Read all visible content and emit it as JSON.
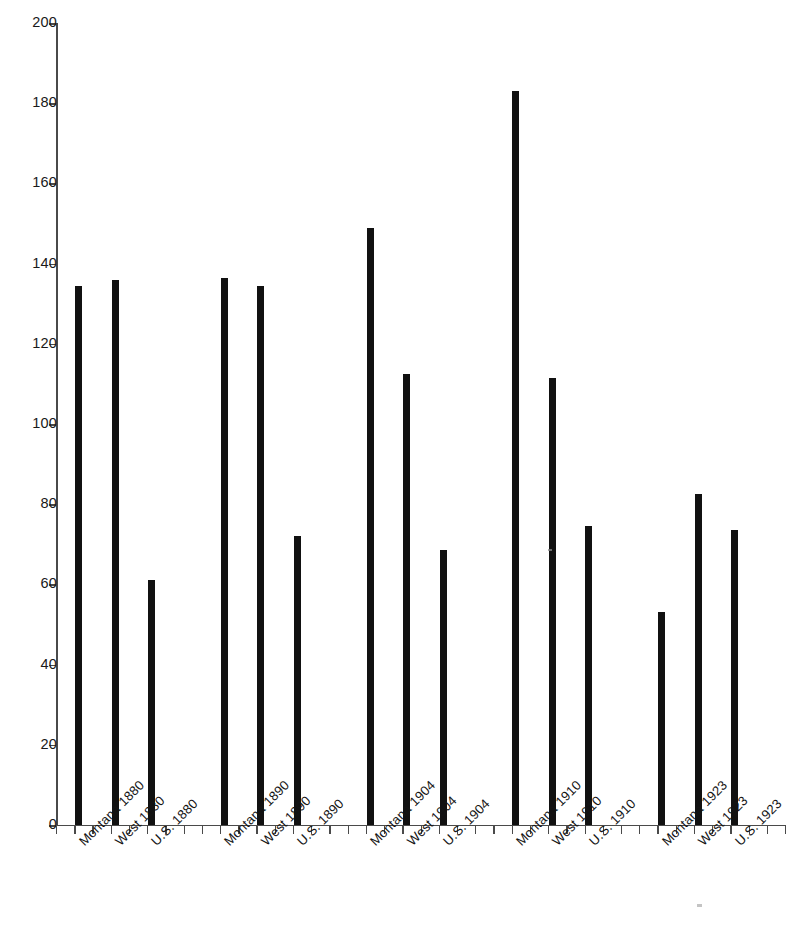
{
  "chart_data": {
    "type": "bar",
    "title": "",
    "subtitle": "",
    "xlabel": "",
    "ylabel": "",
    "ylim": [
      0,
      200
    ],
    "y_ticks": [
      0,
      20,
      40,
      60,
      80,
      100,
      120,
      140,
      160,
      180,
      200
    ],
    "grid": false,
    "legend": false,
    "legend_position": "none",
    "bar_color": "#111111",
    "axis_color": "#4a4a4a",
    "categories": [
      "Montana 1880",
      "West 1880",
      "U.S. 1880",
      "Montana 1890",
      "West 1890",
      "U.S. 1890",
      "Montana 1904",
      "West 1904",
      "U.S. 1904",
      "Montana 1910",
      "West 1910",
      "U.S. 1910",
      "Montana 1923",
      "West 1923",
      "U.S. 1923"
    ],
    "values": [
      134.5,
      136,
      61,
      136.5,
      134.5,
      72,
      149,
      112.5,
      68.5,
      183,
      111.5,
      74.5,
      53,
      82.5,
      73.5
    ],
    "groups": [
      {
        "year": "1880",
        "Montana": 134.5,
        "West": 136,
        "U.S.": 61
      },
      {
        "year": "1890",
        "Montana": 136.5,
        "West": 134.5,
        "U.S.": 72
      },
      {
        "year": "1904",
        "Montana": 149,
        "West": 112.5,
        "U.S.": 68.5
      },
      {
        "year": "1910",
        "Montana": 183,
        "West": 111.5,
        "U.S.": 74.5
      },
      {
        "year": "1923",
        "Montana": 53,
        "West": 82.5,
        "U.S.": 73.5
      }
    ]
  }
}
